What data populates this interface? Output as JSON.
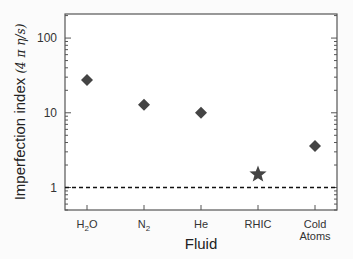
{
  "chart_data": {
    "type": "scatter",
    "title": "",
    "xlabel": "Fluid",
    "ylabel": "Imperfection index",
    "ylabel_suffix": "(4 π η/s)",
    "yscale": "log",
    "ylim": [
      0.5,
      210
    ],
    "yticks": [
      1,
      10,
      100
    ],
    "ytick_labels": [
      "1",
      "10",
      "100"
    ],
    "categories": [
      "H2O",
      "N2",
      "He",
      "RHIC",
      "Cold Atoms"
    ],
    "category_labels": [
      {
        "main": "H",
        "sub": "2",
        "after": "O"
      },
      {
        "main": "N",
        "sub": "2",
        "after": ""
      },
      {
        "main": "He",
        "sub": "",
        "after": ""
      },
      {
        "main": "RHIC",
        "sub": "",
        "after": ""
      },
      {
        "lines": [
          "Cold",
          "Atoms"
        ]
      }
    ],
    "values": [
      27.5,
      12.8,
      10,
      1.5,
      3.6
    ],
    "markers": [
      "diamond",
      "diamond",
      "diamond",
      "star",
      "diamond"
    ],
    "marker_color": "#444444",
    "reference_line": {
      "y": 1,
      "style": "dashed",
      "color": "#111111"
    },
    "grid": false,
    "legend": "none"
  }
}
